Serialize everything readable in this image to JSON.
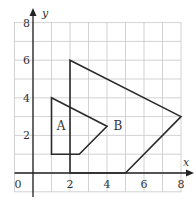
{
  "diagram": {
    "type": "coordinate-grid",
    "x_axis": {
      "label": "x",
      "ticks": [
        "0",
        "2",
        "4",
        "6",
        "8"
      ],
      "range": [
        -1,
        8
      ]
    },
    "y_axis": {
      "label": "y",
      "ticks": [
        "2",
        "4",
        "6",
        "8"
      ],
      "range": [
        -1,
        8
      ]
    },
    "origin_label": "0",
    "shapes": [
      {
        "label": "A",
        "vertices": [
          [
            1,
            4
          ],
          [
            4,
            2.5
          ],
          [
            2.5,
            1
          ],
          [
            1,
            1
          ]
        ]
      },
      {
        "label": "B",
        "vertices": [
          [
            2,
            6
          ],
          [
            8,
            3
          ],
          [
            5,
            0
          ],
          [
            2,
            0
          ]
        ]
      }
    ],
    "colors": {
      "grid": "#c8c8c8",
      "lines": "#2a2a2a",
      "background": "#ffffff"
    }
  }
}
